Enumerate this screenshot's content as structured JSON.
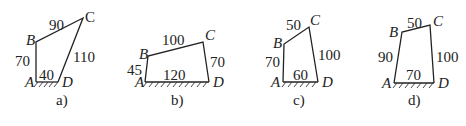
{
  "figures": [
    {
      "caption": "a)",
      "vertices": {
        "A": "A",
        "B": "B",
        "C": "C",
        "D": "D"
      },
      "lengths": {
        "AB": "70",
        "BC": "90",
        "CD": "110",
        "AD": "40"
      }
    },
    {
      "caption": "b)",
      "vertices": {
        "A": "A",
        "B": "B",
        "C": "C",
        "D": "D"
      },
      "lengths": {
        "AB": "45",
        "BC": "100",
        "CD": "70",
        "AD": "120"
      }
    },
    {
      "caption": "c)",
      "vertices": {
        "A": "A",
        "B": "B",
        "C": "C",
        "D": "D"
      },
      "lengths": {
        "AB": "70",
        "BC": "50",
        "CD": "100",
        "AD": "60"
      }
    },
    {
      "caption": "d)",
      "vertices": {
        "A": "A",
        "B": "B",
        "C": "C",
        "D": "D"
      },
      "lengths": {
        "AB": "90",
        "BC": "50",
        "CD": "100",
        "AD": "70"
      }
    }
  ]
}
